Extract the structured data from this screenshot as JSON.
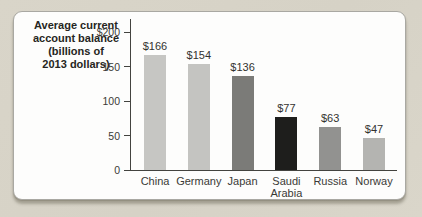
{
  "chart_data": {
    "type": "bar",
    "title": "Average current account balance (billions of 2013 dollars)",
    "title_lines": [
      "Average current",
      "account balance",
      "(billions of",
      "2013 dollars)"
    ],
    "categories": [
      "China",
      "Germany",
      "Japan",
      "Saudi\nArabia",
      "Russia",
      "Norway"
    ],
    "values": [
      166,
      154,
      136,
      77,
      63,
      47
    ],
    "value_labels": [
      "$166",
      "$154",
      "$136",
      "$77",
      "$63",
      "$47"
    ],
    "bar_colors": [
      "#c6c6c3",
      "#c4c4c1",
      "#7b7b78",
      "#1e1e1c",
      "#929290",
      "#b4b4b1"
    ],
    "xlabel": "",
    "ylabel": "",
    "ylim": [
      0,
      200
    ],
    "yticks": [
      {
        "value": 200,
        "label": "$200"
      },
      {
        "value": 150,
        "label": "150"
      },
      {
        "value": 100,
        "label": "100"
      },
      {
        "value": 50,
        "label": "50"
      },
      {
        "value": 0,
        "label": "0"
      }
    ],
    "grid": false,
    "legend": "none"
  },
  "style": {
    "page_background": "#d8d4c8",
    "panel_background": "#fdfdfc",
    "axis_color": "#43433f",
    "text_color": "#3a3a36"
  }
}
